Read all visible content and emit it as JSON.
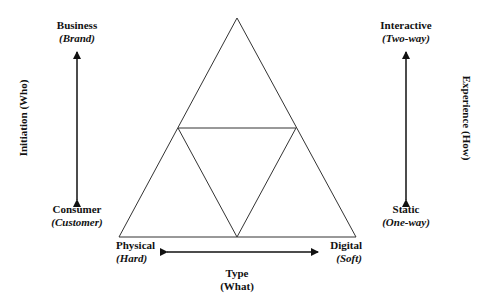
{
  "diagram": {
    "type": "triangle-framework",
    "axes": {
      "initiation": {
        "label": "Initiation (Who)",
        "top": {
          "main": "Business",
          "sub": "(Brand)"
        },
        "bottom": {
          "main": "Consumer",
          "sub": "(Customer)"
        }
      },
      "experience": {
        "label": "Experience (How)",
        "top": {
          "main": "Interactive",
          "sub": "(Two-way)"
        },
        "bottom": {
          "main": "Static",
          "sub": "(One-way)"
        }
      },
      "type": {
        "label_main": "Type",
        "label_sub": "(What)",
        "left": {
          "main": "Physical",
          "sub": "(Hard)"
        },
        "right": {
          "main": "Digital",
          "sub": "(Soft)"
        }
      }
    },
    "colors": {
      "line": "#222222",
      "background": "#ffffff"
    }
  }
}
